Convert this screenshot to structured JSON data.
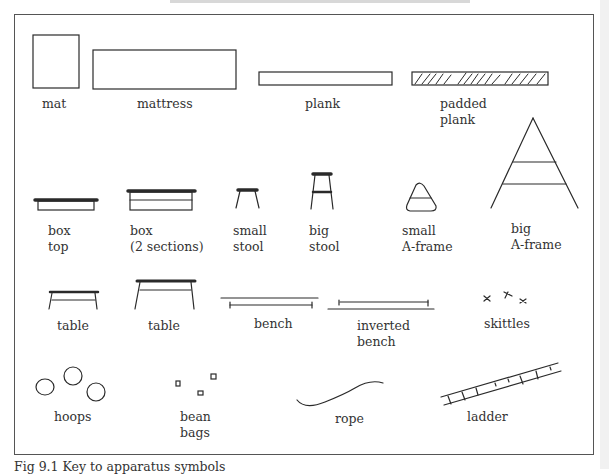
{
  "figure": {
    "caption": "Fig 9.1  Key to apparatus symbols",
    "items": [
      {
        "label": "mat"
      },
      {
        "label": "mattress"
      },
      {
        "label": "plank"
      },
      {
        "label": "padded\nplank"
      },
      {
        "label": "box\ntop"
      },
      {
        "label": "box\n(2 sections)"
      },
      {
        "label": "small\nstool"
      },
      {
        "label": "big\nstool"
      },
      {
        "label": "small\nA-frame"
      },
      {
        "label": "big\nA-frame"
      },
      {
        "label": "table"
      },
      {
        "label": "table"
      },
      {
        "label": "bench"
      },
      {
        "label": "inverted\nbench"
      },
      {
        "label": "skittles"
      },
      {
        "label": "hoops"
      },
      {
        "label": "bean\nbags"
      },
      {
        "label": "rope"
      },
      {
        "label": "ladder"
      }
    ]
  },
  "colors": {
    "ink": "#2a2a2a",
    "frame": "#555555",
    "background": "#ffffff"
  }
}
